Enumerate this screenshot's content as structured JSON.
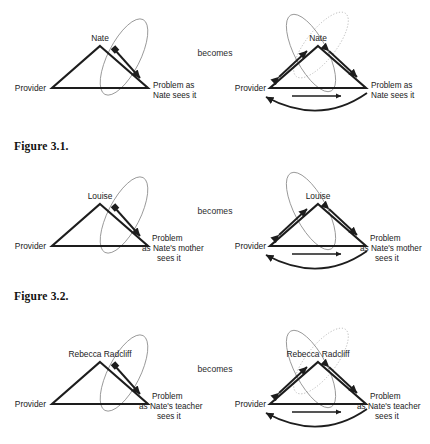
{
  "document": {
    "type": "figure-illustration",
    "page_background": "#ffffff",
    "ink_color": "#1d1d1d",
    "ellipse_color": "#8c8c8c",
    "dotted_ellipse_color": "#b0b0b0"
  },
  "transition_label": "becomes",
  "figures": [
    {
      "caption": "Figure 3.1.",
      "before": {
        "apex_label": "Nate",
        "left_label": "Provider",
        "right_label_lines": [
          "Problem as",
          "Nate sees it"
        ],
        "ellipses": [
          "solid"
        ],
        "relations": [
          "apex-to-right-bidirectional"
        ]
      },
      "after": {
        "apex_label": "Nate",
        "left_label": "Provider",
        "right_label_lines": [
          "Problem as",
          "Nate sees it"
        ],
        "ellipses": [
          "solid",
          "dotted"
        ],
        "relations": [
          "left-to-apex-bidirectional",
          "apex-to-right-bidirectional",
          "left-to-right-arrow",
          "right-to-left-arc"
        ]
      }
    },
    {
      "caption": "Figure 3.2.",
      "before": {
        "apex_label": "Louise",
        "left_label": "Provider",
        "right_label_lines": [
          "Problem",
          "as Nate's mother",
          "sees it"
        ],
        "ellipses": [
          "solid"
        ],
        "relations": [
          "apex-to-right-bidirectional"
        ]
      },
      "after": {
        "apex_label": "Louise",
        "left_label": "Provider",
        "right_label_lines": [
          "Problem",
          "as Nate's mother",
          "sees it"
        ],
        "ellipses": [
          "solid"
        ],
        "relations": [
          "left-to-apex-bidirectional",
          "apex-to-right-bidirectional",
          "left-to-right-arrow",
          "right-to-left-arc"
        ]
      }
    },
    {
      "caption": "",
      "before": {
        "apex_label": "Rebecca Radcliff",
        "left_label": "Provider",
        "right_label_lines": [
          "Problem",
          "as Nate's teacher",
          "sees it"
        ],
        "ellipses": [
          "solid"
        ],
        "relations": [
          "apex-to-right-bidirectional"
        ]
      },
      "after": {
        "apex_label": "Rebecca Radcliff",
        "left_label": "Provider",
        "right_label_lines": [
          "Problem",
          "as Nate's teacher",
          "sees it"
        ],
        "ellipses": [
          "solid",
          "dotted"
        ],
        "relations": [
          "left-to-apex-bidirectional",
          "apex-to-right-bidirectional",
          "left-to-right-arrow",
          "right-to-left-arc"
        ]
      }
    }
  ]
}
